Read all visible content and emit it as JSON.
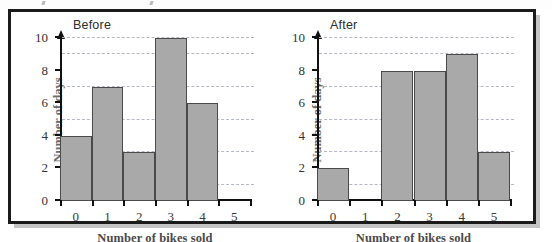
{
  "figure": {
    "panels": [
      {
        "key": "before",
        "title": "Before",
        "xlabel": "Number of bikes sold",
        "ylabel": "Number of days",
        "ytick_labels": [
          "0",
          "2",
          "4",
          "6",
          "8",
          "10"
        ],
        "xtick_labels": [
          "0",
          "1",
          "2",
          "3",
          "4",
          "5"
        ]
      },
      {
        "key": "after",
        "title": "After",
        "xlabel": "Number of bikes sold",
        "ylabel": "Number of days",
        "ytick_labels": [
          "0",
          "2",
          "4",
          "6",
          "8",
          "10"
        ],
        "xtick_labels": [
          "0",
          "1",
          "2",
          "3",
          "4",
          "5"
        ]
      }
    ],
    "colors": {
      "bar_fill": "#a9a9a9",
      "bar_stroke": "#4a4a4a",
      "axis": "#111111",
      "gridline": "#b3b8c2",
      "frame": "#1b1b1b",
      "background": "#ffffff"
    }
  },
  "chart_data": [
    {
      "type": "bar",
      "title": "Before",
      "xlabel": "Number of bikes sold",
      "ylabel": "Number of days",
      "categories": [
        "0",
        "1",
        "2",
        "3",
        "4",
        "5"
      ],
      "values": [
        4,
        7,
        3,
        10,
        6,
        0
      ],
      "ylim": [
        0,
        10
      ],
      "ytick_values": [
        0,
        2,
        4,
        6,
        8,
        10
      ],
      "gridline_values": [
        1,
        3,
        5,
        7,
        9,
        10
      ],
      "grid": true,
      "legend": "none"
    },
    {
      "type": "bar",
      "title": "After",
      "xlabel": "Number of bikes sold",
      "ylabel": "Number of days",
      "categories": [
        "0",
        "1",
        "2",
        "3",
        "4",
        "5"
      ],
      "values": [
        2,
        0,
        8,
        8,
        9,
        3
      ],
      "ylim": [
        0,
        10
      ],
      "ytick_values": [
        0,
        2,
        4,
        6,
        8,
        10
      ],
      "gridline_values": [
        1,
        3,
        5,
        7,
        9,
        10
      ],
      "grid": true,
      "legend": "none"
    }
  ]
}
